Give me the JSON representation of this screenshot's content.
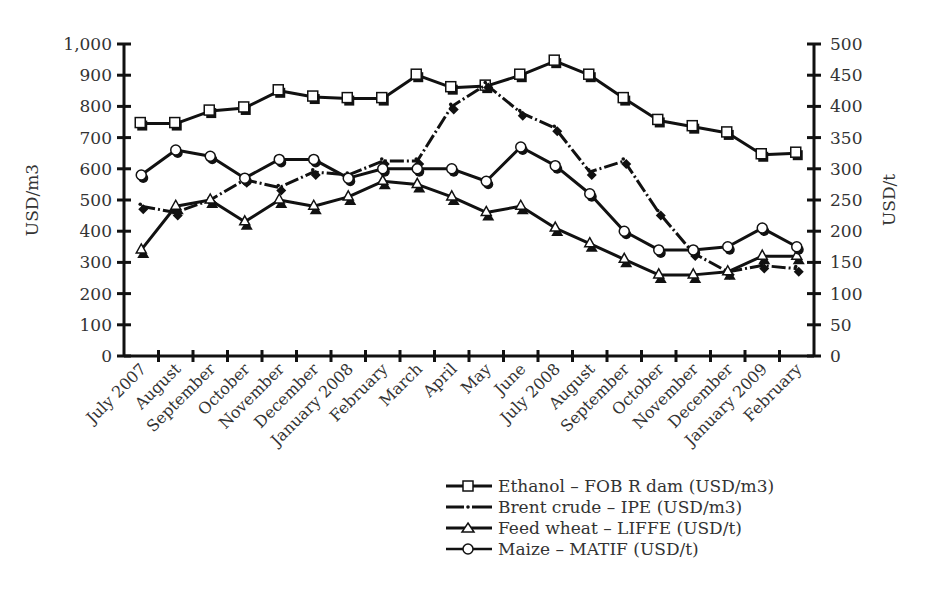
{
  "chart_data": {
    "type": "line",
    "title": "",
    "xlabel": "",
    "ylabel": "USD/m3",
    "ylabel_right": "USD/t",
    "ylim": [
      0,
      1000
    ],
    "ylim_right": [
      0,
      500
    ],
    "yticks": [
      "0",
      "100",
      "200",
      "300",
      "400",
      "500",
      "600",
      "700",
      "800",
      "900",
      "1,000"
    ],
    "yticks_right": [
      "0",
      "50",
      "100",
      "150",
      "200",
      "250",
      "300",
      "350",
      "400",
      "450",
      "500"
    ],
    "grid": false,
    "legend_position": "bottom-right",
    "categories": [
      "July 2007",
      "August",
      "September",
      "October",
      "November",
      "December",
      "January 2008",
      "February",
      "March",
      "April",
      "May",
      "June",
      "July 2008",
      "August",
      "September",
      "October",
      "November",
      "December",
      "January 2009",
      "February"
    ],
    "series": [
      {
        "name": "Ethanol – FOB R dam (USD/m3)",
        "axis": "left",
        "marker": "square",
        "values": [
          745,
          745,
          785,
          795,
          850,
          830,
          825,
          825,
          900,
          860,
          865,
          900,
          945,
          900,
          825,
          755,
          735,
          715,
          645,
          650
        ]
      },
      {
        "name": "Brent crude – IPE (USD/m3)",
        "axis": "left",
        "marker": "diamond",
        "values": [
          480,
          460,
          500,
          565,
          540,
          590,
          580,
          625,
          625,
          800,
          870,
          780,
          730,
          590,
          625,
          460,
          330,
          270,
          290,
          280
        ]
      },
      {
        "name": "Feed wheat – LIFFE (USD/t)",
        "axis": "right",
        "marker": "triangle",
        "values": [
          170,
          240,
          250,
          215,
          250,
          240,
          255,
          280,
          275,
          255,
          230,
          240,
          205,
          180,
          155,
          130,
          130,
          135,
          160,
          160
        ]
      },
      {
        "name": "Maize – MATIF (USD/t)",
        "axis": "right",
        "marker": "circle",
        "values": [
          290,
          330,
          320,
          285,
          315,
          315,
          285,
          300,
          300,
          300,
          280,
          335,
          305,
          260,
          200,
          170,
          170,
          175,
          205,
          175
        ]
      }
    ]
  },
  "legend": {
    "items": [
      {
        "label": "Ethanol – FOB R dam (USD/m3)",
        "icon": "square-marker-icon"
      },
      {
        "label": "Brent crude – IPE (USD/m3)",
        "icon": "dot-marker-icon"
      },
      {
        "label": "Feed wheat – LIFFE (USD/t)",
        "icon": "triangle-marker-icon"
      },
      {
        "label": "Maize – MATIF (USD/t)",
        "icon": "circle-marker-icon"
      }
    ]
  },
  "colors": {
    "line": "#111111",
    "text": "#333333",
    "background": "#ffffff"
  }
}
